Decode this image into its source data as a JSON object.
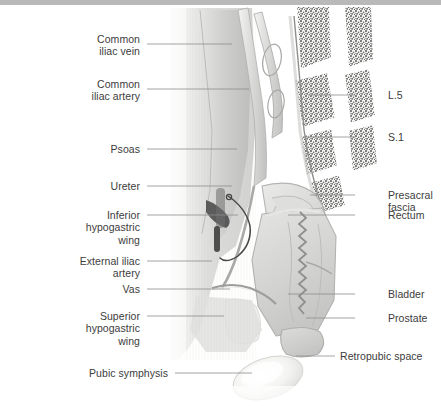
{
  "figure": {
    "type": "medical-illustration",
    "style": "grayscale halftone anatomical drawing",
    "background_color": "#ffffff",
    "text_color": "#3c3c3c",
    "leader_color": "#8d8d8d",
    "top_bar_color": "#b9b9b9"
  },
  "labels_left": [
    {
      "id": "common-iliac-vein",
      "lines": [
        "Common",
        "iliac vein"
      ],
      "x": 140,
      "y": 33,
      "leader": {
        "x1": 147,
        "y1": 44,
        "x2": 232,
        "y2": 44
      }
    },
    {
      "id": "common-iliac-artery",
      "lines": [
        "Common",
        "iliac artery"
      ],
      "x": 140,
      "y": 78,
      "leader": {
        "x1": 147,
        "y1": 89,
        "x2": 249,
        "y2": 89
      }
    },
    {
      "id": "psoas",
      "lines": [
        "Psoas"
      ],
      "x": 140,
      "y": 143,
      "leader": {
        "x1": 147,
        "y1": 149,
        "x2": 237,
        "y2": 149
      }
    },
    {
      "id": "ureter",
      "lines": [
        "Ureter"
      ],
      "x": 140,
      "y": 180,
      "leader": {
        "x1": 147,
        "y1": 186,
        "x2": 232,
        "y2": 186
      }
    },
    {
      "id": "inferior-hypogastric-wing",
      "lines": [
        "Inferior",
        "hypogastric",
        "wing"
      ],
      "x": 140,
      "y": 209,
      "leader": {
        "x1": 147,
        "y1": 215,
        "x2": 238,
        "y2": 215
      }
    },
    {
      "id": "external-iliac-artery",
      "lines": [
        "External iliac",
        "artery"
      ],
      "x": 140,
      "y": 255,
      "leader": {
        "x1": 147,
        "y1": 261,
        "x2": 212,
        "y2": 261
      }
    },
    {
      "id": "vas",
      "lines": [
        "Vas"
      ],
      "x": 140,
      "y": 283,
      "leader": {
        "x1": 147,
        "y1": 289,
        "x2": 230,
        "y2": 289
      }
    },
    {
      "id": "superior-hypogastric-wing",
      "lines": [
        "Superior",
        "hypogastric",
        "wing"
      ],
      "x": 140,
      "y": 310,
      "leader": {
        "x1": 147,
        "y1": 316,
        "x2": 224,
        "y2": 316
      }
    },
    {
      "id": "pubic-symphysis",
      "lines": [
        "Pubic symphysis"
      ],
      "x": 168,
      "y": 367,
      "leader": {
        "x1": 175,
        "y1": 373,
        "x2": 252,
        "y2": 373
      }
    }
  ],
  "labels_right": [
    {
      "id": "l5",
      "lines": [
        "L.5"
      ],
      "x": 388,
      "y": 89,
      "leader": {
        "x1": 355,
        "y1": 95,
        "x2": 308,
        "y2": 95
      }
    },
    {
      "id": "s1",
      "lines": [
        "S.1"
      ],
      "x": 388,
      "y": 131,
      "leader": {
        "x1": 355,
        "y1": 137,
        "x2": 304,
        "y2": 137
      }
    },
    {
      "id": "presacral-fascia",
      "lines": [
        "Presacral",
        "fascia"
      ],
      "x": 388,
      "y": 189,
      "leader": {
        "x1": 355,
        "y1": 195,
        "x2": 310,
        "y2": 195
      }
    },
    {
      "id": "rectum",
      "lines": [
        "Rectum"
      ],
      "x": 388,
      "y": 209,
      "leader": {
        "x1": 355,
        "y1": 215,
        "x2": 288,
        "y2": 215
      }
    },
    {
      "id": "bladder",
      "lines": [
        "Bladder"
      ],
      "x": 388,
      "y": 288,
      "leader": {
        "x1": 355,
        "y1": 294,
        "x2": 288,
        "y2": 294
      }
    },
    {
      "id": "prostate",
      "lines": [
        "Prostate"
      ],
      "x": 388,
      "y": 312,
      "leader": {
        "x1": 355,
        "y1": 318,
        "x2": 306,
        "y2": 318
      }
    },
    {
      "id": "retropubic-space",
      "lines": [
        "Retropubic space"
      ],
      "x": 340,
      "y": 350,
      "leader": {
        "x1": 335,
        "y1": 356,
        "x2": 296,
        "y2": 356
      }
    }
  ]
}
